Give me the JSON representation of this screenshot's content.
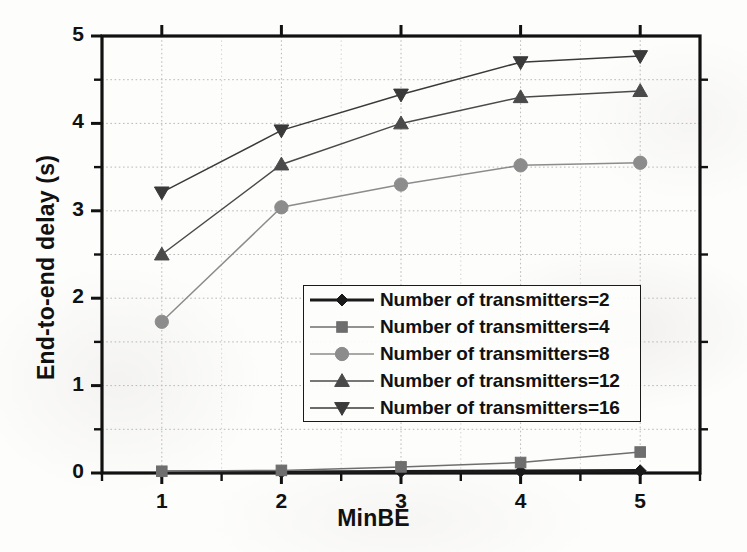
{
  "chart_data": {
    "type": "line",
    "title": "",
    "xlabel": "MinBE",
    "ylabel": "End-to-end delay (s)",
    "x": [
      1,
      2,
      3,
      4,
      5
    ],
    "xlim": [
      0.5,
      5.5
    ],
    "ylim": [
      0,
      5
    ],
    "xticks": [
      "1",
      "2",
      "3",
      "4",
      "5"
    ],
    "yticks": [
      "0",
      "1",
      "2",
      "3",
      "4",
      "5"
    ],
    "y_minor_step": 0.5,
    "grid": "dotted minor and major gridlines, light gray",
    "legend_position": "center-right, inside axes",
    "series": [
      {
        "name": "Number of transmitters=2",
        "marker": "diamond",
        "color": "#1a1a1a",
        "values": [
          0.01,
          0.01,
          0.015,
          0.02,
          0.025
        ]
      },
      {
        "name": "Number of transmitters=4",
        "marker": "square",
        "color": "#6e6e6e",
        "values": [
          0.02,
          0.03,
          0.07,
          0.12,
          0.24
        ]
      },
      {
        "name": "Number of transmitters=8",
        "marker": "circle",
        "color": "#8c8c8c",
        "values": [
          1.73,
          3.04,
          3.3,
          3.52,
          3.55
        ]
      },
      {
        "name": "Number of transmitters=12",
        "marker": "triangle-up",
        "color": "#4a4a4a",
        "values": [
          2.5,
          3.53,
          4.0,
          4.3,
          4.37
        ]
      },
      {
        "name": "Number of transmitters=16",
        "marker": "triangle-down",
        "color": "#3a3a3a",
        "values": [
          3.21,
          3.92,
          4.33,
          4.7,
          4.77
        ]
      }
    ]
  },
  "axes": {
    "y_title": "End-to-end delay (s)",
    "x_title": "MinBE",
    "y_tick_labels": [
      "5",
      "4",
      "3",
      "2",
      "1",
      "0"
    ],
    "x_tick_labels": [
      "1",
      "2",
      "3",
      "4",
      "5"
    ]
  },
  "legend": {
    "entries": [
      {
        "label": "Number of transmitters=2",
        "marker": "diamond",
        "color": "#1a1a1a"
      },
      {
        "label": "Number of transmitters=4",
        "marker": "square",
        "color": "#6e6e6e"
      },
      {
        "label": "Number of transmitters=8",
        "marker": "circle",
        "color": "#8c8c8c"
      },
      {
        "label": "Number of transmitters=12",
        "marker": "triangle-up",
        "color": "#4a4a4a"
      },
      {
        "label": "Number of transmitters=16",
        "marker": "triangle-down",
        "color": "#3a3a3a"
      }
    ]
  },
  "style": {
    "axis_color": "#111111",
    "grid_color": "#b9b9b9",
    "background": "#fdfdfc"
  }
}
